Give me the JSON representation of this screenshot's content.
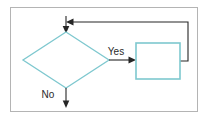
{
  "diagram": {
    "background_color": "#ffffff",
    "frame_color": "#b4b4b4",
    "shape_stroke_color": "#7ec8cf",
    "shape_fill_color": "#ffffff",
    "edge_color": "#262626",
    "label_color": "#2b2b2b",
    "nodes": [
      {
        "id": "decision",
        "type": "diamond",
        "label": "",
        "cx": 66,
        "cy": 60,
        "rx": 43,
        "ry": 28
      },
      {
        "id": "process",
        "type": "rectangle",
        "label": "",
        "x": 136,
        "y": 43,
        "width": 44,
        "height": 36
      }
    ],
    "edges": [
      {
        "id": "edge-yes",
        "from": "decision",
        "to": "process",
        "label": "Yes",
        "label_x": 116,
        "label_y": 55,
        "arrowhead": "right"
      },
      {
        "id": "edge-no",
        "from": "decision",
        "to": "exit",
        "label": "No",
        "label_x": 48,
        "label_y": 98,
        "arrowhead": "down"
      },
      {
        "id": "edge-loopback",
        "from": "process",
        "to": "decision",
        "label": "",
        "arrowhead": "left"
      },
      {
        "id": "edge-entry",
        "from": "entry",
        "to": "decision",
        "label": "",
        "arrowhead": "down"
      }
    ],
    "labels": {
      "yes": "Yes",
      "no": "No"
    }
  }
}
